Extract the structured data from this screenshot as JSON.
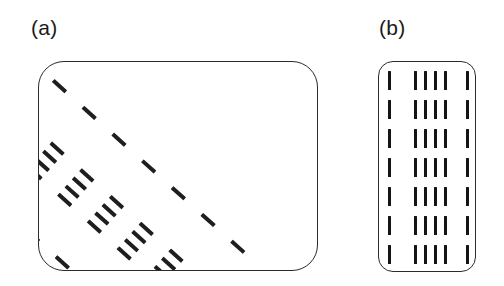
{
  "figure": {
    "type": "diagram",
    "background_color": "#ffffff",
    "stroke_color": "#2b2b2b",
    "tick_color": "#1e1e1e",
    "panels": [
      {
        "id": "a",
        "label": "(a)",
        "shape": "rounded-rectangle",
        "corner_radius": 26,
        "x": 38,
        "y": 61,
        "width": 280,
        "height": 210,
        "pattern": {
          "orientation": "tilted",
          "rotation_deg": -48,
          "rows": 7,
          "row_spacing": 40,
          "groups_per_row": [
            1,
            4,
            1
          ],
          "group_gap": 26,
          "tick_spacing": 11,
          "tick_length": 17,
          "tick_width": 3.6
        }
      },
      {
        "id": "b",
        "label": "(b)",
        "shape": "rounded-rectangle",
        "corner_radius": 15,
        "x": 378,
        "y": 61,
        "width": 98,
        "height": 211,
        "pattern": {
          "orientation": "upright",
          "rotation_deg": 0,
          "rows": 7,
          "row_spacing": 29,
          "groups_per_row": [
            1,
            4,
            1
          ],
          "group_gap": 26,
          "tick_spacing": 10,
          "tick_length": 19,
          "tick_width": 3.4
        }
      }
    ]
  },
  "panel_a_rows": [
    {
      "y": 15,
      "ticks": [
        14,
        62,
        73,
        84,
        95,
        143
      ]
    },
    {
      "y": 55,
      "ticks": [
        14,
        62,
        73,
        84,
        95,
        143
      ]
    },
    {
      "y": 95,
      "ticks": [
        14,
        62,
        73,
        84,
        95,
        143
      ]
    },
    {
      "y": 135,
      "ticks": [
        14,
        62,
        73,
        84,
        95,
        143
      ]
    },
    {
      "y": 175,
      "ticks": [
        14,
        62,
        73,
        84,
        95,
        143
      ]
    },
    {
      "y": 215,
      "ticks": [
        14,
        62,
        73,
        84,
        95,
        143
      ]
    },
    {
      "y": 255,
      "ticks": [
        14,
        62,
        73,
        84,
        95,
        143
      ]
    }
  ],
  "panel_b_rows": [
    {
      "y": 9,
      "ticks": [
        9,
        35,
        45,
        55,
        65,
        87
      ]
    },
    {
      "y": 38,
      "ticks": [
        9,
        35,
        45,
        55,
        65,
        87
      ]
    },
    {
      "y": 67,
      "ticks": [
        9,
        35,
        45,
        55,
        65,
        87
      ]
    },
    {
      "y": 96,
      "ticks": [
        9,
        35,
        45,
        55,
        65,
        87
      ]
    },
    {
      "y": 125,
      "ticks": [
        9,
        35,
        45,
        55,
        65,
        87
      ]
    },
    {
      "y": 154,
      "ticks": [
        9,
        35,
        45,
        55,
        65,
        87
      ]
    },
    {
      "y": 183,
      "ticks": [
        9,
        35,
        45,
        55,
        65,
        87
      ]
    }
  ]
}
